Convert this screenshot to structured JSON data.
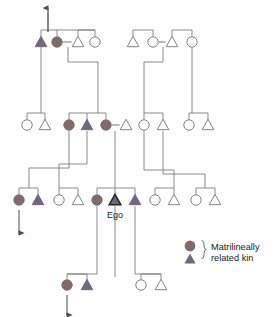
{
  "diagram": {
    "ego_label": "Ego",
    "colors": {
      "line": "#7b7b86",
      "line_dark": "#222222",
      "female_fill": "#7e6c6c",
      "male_fill": "#6e6878",
      "open_fill": "#ffffff",
      "text": "#1a1a1a",
      "marriage_link": "#b9b9c2"
    },
    "symbol_legend": {
      "female_symbol": "filled-circle",
      "male_symbol": "filled-triangle",
      "open_female_symbol": "open-circle",
      "open_male_symbol": "open-triangle"
    }
  },
  "legend": {
    "line1": "Matrilineally",
    "line2": "related kin",
    "brace": "}",
    "circle_name": "legend-filled-circle",
    "triangle_name": "legend-filled-triangle"
  },
  "generations": [
    {
      "id": "gen1",
      "name": "grandparent-generation",
      "y": 42,
      "people": [
        {
          "id": "g1a",
          "shape": "triangle",
          "fill": "male",
          "x": 41,
          "name": "g1-male-filled"
        },
        {
          "id": "g1b",
          "shape": "circle",
          "fill": "female",
          "x": 57,
          "name": "g1-female-filled"
        },
        {
          "id": "g1c",
          "shape": "triangle",
          "fill": "open",
          "x": 78,
          "name": "g1-male-open"
        },
        {
          "id": "g1d",
          "shape": "circle",
          "fill": "open",
          "x": 95,
          "name": "g1-female-open-2"
        },
        {
          "id": "g1e",
          "shape": "triangle",
          "fill": "open",
          "x": 133,
          "name": "g1-male-open-3"
        },
        {
          "id": "g1f",
          "shape": "circle",
          "fill": "open",
          "x": 153,
          "name": "g1-female-open-4"
        },
        {
          "id": "g1g",
          "shape": "triangle",
          "fill": "open",
          "x": 172,
          "name": "g1-male-open-5"
        },
        {
          "id": "g1h",
          "shape": "circle",
          "fill": "open",
          "x": 192,
          "name": "g1-female-open-6"
        }
      ],
      "marriages": [
        {
          "a": 57,
          "b": 78,
          "name": "marriage-g1-1"
        },
        {
          "a": 153,
          "b": 172,
          "name": "marriage-g1-2"
        }
      ]
    },
    {
      "id": "gen2",
      "name": "parent-generation",
      "y": 125,
      "people": [
        {
          "id": "g2a",
          "shape": "circle",
          "fill": "open",
          "x": 27,
          "name": "g2-female-open-1"
        },
        {
          "id": "g2b",
          "shape": "triangle",
          "fill": "open",
          "x": 45,
          "name": "g2-male-open-1"
        },
        {
          "id": "g2c",
          "shape": "circle",
          "fill": "female",
          "x": 69,
          "name": "g2-female-filled-1"
        },
        {
          "id": "g2d",
          "shape": "triangle",
          "fill": "male",
          "x": 87,
          "name": "g2-male-filled-1"
        },
        {
          "id": "g2e",
          "shape": "circle",
          "fill": "female",
          "x": 106,
          "name": "g2-mother-of-ego"
        },
        {
          "id": "g2f",
          "shape": "triangle",
          "fill": "open",
          "x": 126,
          "name": "g2-father-of-ego"
        },
        {
          "id": "g2g",
          "shape": "circle",
          "fill": "open",
          "x": 144,
          "name": "g2-female-open-2"
        },
        {
          "id": "g2h",
          "shape": "triangle",
          "fill": "open",
          "x": 163,
          "name": "g2-male-open-2"
        },
        {
          "id": "g2i",
          "shape": "circle",
          "fill": "open",
          "x": 189,
          "name": "g2-female-open-3"
        },
        {
          "id": "g2j",
          "shape": "triangle",
          "fill": "open",
          "x": 208,
          "name": "g2-male-open-3"
        }
      ],
      "marriages": [
        {
          "a": 106,
          "b": 126,
          "name": "marriage-g2-ego-parents"
        }
      ]
    },
    {
      "id": "gen3",
      "name": "ego-generation",
      "y": 200,
      "people": [
        {
          "id": "g3a",
          "shape": "circle",
          "fill": "female",
          "x": 19,
          "name": "g3-female-filled-1"
        },
        {
          "id": "g3b",
          "shape": "triangle",
          "fill": "male",
          "x": 38,
          "name": "g3-male-filled-1"
        },
        {
          "id": "g3c",
          "shape": "circle",
          "fill": "open",
          "x": 59,
          "name": "g3-female-open-1"
        },
        {
          "id": "g3d",
          "shape": "triangle",
          "fill": "open",
          "x": 78,
          "name": "g3-male-open-1"
        },
        {
          "id": "g3e",
          "shape": "circle",
          "fill": "female",
          "x": 97,
          "name": "g3-sister-of-ego"
        },
        {
          "id": "g3f",
          "shape": "triangle",
          "fill": "ego",
          "x": 115,
          "name": "ego-symbol"
        },
        {
          "id": "g3g",
          "shape": "triangle",
          "fill": "male",
          "x": 135,
          "name": "g3-brother-of-ego"
        },
        {
          "id": "g3h",
          "shape": "circle",
          "fill": "open",
          "x": 155,
          "name": "g3-female-open-2"
        },
        {
          "id": "g3i",
          "shape": "triangle",
          "fill": "open",
          "x": 174,
          "name": "g3-male-open-2"
        },
        {
          "id": "g3j",
          "shape": "circle",
          "fill": "open",
          "x": 196,
          "name": "g3-female-open-3"
        },
        {
          "id": "g3k",
          "shape": "triangle",
          "fill": "open",
          "x": 215,
          "name": "g3-male-open-3"
        }
      ],
      "marriages": []
    },
    {
      "id": "gen4",
      "name": "child-generation",
      "y": 285,
      "people": [
        {
          "id": "g4a",
          "shape": "circle",
          "fill": "female",
          "x": 67,
          "name": "g4-female-filled-1"
        },
        {
          "id": "g4b",
          "shape": "triangle",
          "fill": "male",
          "x": 87,
          "name": "g4-male-filled-1"
        },
        {
          "id": "g4c",
          "shape": "circle",
          "fill": "open",
          "x": 141,
          "name": "g4-female-open-1"
        },
        {
          "id": "g4d",
          "shape": "triangle",
          "fill": "open",
          "x": 161,
          "name": "g4-male-open-1"
        }
      ],
      "marriages": []
    }
  ],
  "arrows": [
    {
      "id": "a1",
      "name": "ascend-arrow-top",
      "x": 48,
      "y1": 32,
      "y2": 8,
      "dir": "up"
    },
    {
      "id": "a2",
      "name": "descend-arrow-left",
      "x": 19,
      "y1": 210,
      "y2": 233,
      "dir": "down"
    },
    {
      "id": "a3",
      "name": "descend-arrow-bottom",
      "x": 67,
      "y1": 295,
      "y2": 315,
      "dir": "down"
    }
  ]
}
